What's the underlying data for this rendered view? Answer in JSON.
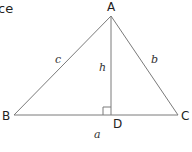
{
  "fragment_text": "ce",
  "vertices": {
    "A": "A",
    "B": "B",
    "C": "C",
    "D": "D"
  },
  "sides": {
    "a": "a",
    "b": "b",
    "c": "c",
    "h": "h"
  },
  "colors": {
    "line": "#7a7a7a",
    "text": "#222222"
  }
}
